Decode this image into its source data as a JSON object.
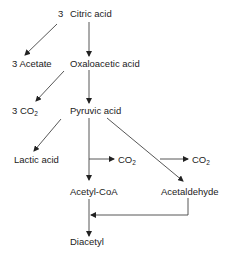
{
  "diagram": {
    "type": "metabolic-pathway",
    "nodes": [
      {
        "id": "coef_citric",
        "label": "3"
      },
      {
        "id": "citric_acid",
        "label": "Citric acid"
      },
      {
        "id": "acetate",
        "label": "3 Acetate"
      },
      {
        "id": "oxaloacetic_acid",
        "label": "Oxaloacetic acid"
      },
      {
        "id": "co2_3",
        "label": "3 CO",
        "sub": "2"
      },
      {
        "id": "pyruvic_acid",
        "label": "Pyruvic acid"
      },
      {
        "id": "lactic_acid",
        "label": "Lactic acid"
      },
      {
        "id": "co2_a",
        "label": "CO",
        "sub": "2"
      },
      {
        "id": "co2_b",
        "label": "CO",
        "sub": "2"
      },
      {
        "id": "acetyl_coa",
        "label": "Acetyl-CoA"
      },
      {
        "id": "acetaldehyde",
        "label": "Acetaldehyde"
      },
      {
        "id": "diacetyl",
        "label": "Diacetyl"
      }
    ],
    "edges": [
      {
        "from": "citric_acid",
        "to": "acetate"
      },
      {
        "from": "citric_acid",
        "to": "oxaloacetic_acid"
      },
      {
        "from": "oxaloacetic_acid",
        "to": "co2_3"
      },
      {
        "from": "oxaloacetic_acid",
        "to": "pyruvic_acid"
      },
      {
        "from": "pyruvic_acid",
        "to": "lactic_acid"
      },
      {
        "from": "pyruvic_acid",
        "to": "co2_a"
      },
      {
        "from": "pyruvic_acid",
        "to": "acetyl_coa"
      },
      {
        "from": "pyruvic_acid",
        "to": "acetaldehyde"
      },
      {
        "from": "pyruvic_acid",
        "to": "co2_b"
      },
      {
        "from": "acetyl_coa",
        "to": "diacetyl"
      },
      {
        "from": "acetaldehyde",
        "to": "diacetyl"
      }
    ],
    "colors": {
      "line": "#333333",
      "text": "#222222",
      "background": "#ffffff"
    }
  }
}
